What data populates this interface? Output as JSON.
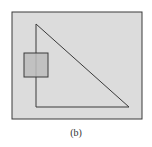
{
  "caption": "(b)",
  "colors": {
    "background": "#ffffff",
    "outer_fill": "#dcdcdc",
    "stroke": "#3a3a3a",
    "small_rect_fill": "#bcbcbc"
  },
  "shapes": {
    "outer_rect": {
      "x": 12,
      "y": 12,
      "width": 130,
      "height": 107
    },
    "triangle": {
      "points": [
        [
          36,
          24
        ],
        [
          36,
          107
        ],
        [
          129,
          107
        ]
      ]
    },
    "small_rect": {
      "x": 24,
      "y": 53,
      "width": 24,
      "height": 24
    }
  }
}
